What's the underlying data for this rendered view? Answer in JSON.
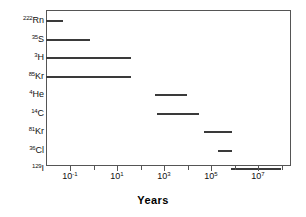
{
  "chart_data": {
    "type": "bar",
    "title": "",
    "xlabel": "Years",
    "ylabel": "",
    "xscale": "log",
    "xlim": [
      0.003,
      300000000
    ],
    "grid": false,
    "legend": null,
    "orientation": "horizontal-range",
    "note": "Applicable dating range of each radio-isotope tracer, shown as a horizontal span on a logarithmic time axis.",
    "categories": [
      "222Rn",
      "35S",
      "3H",
      "85Kr",
      "4He",
      "14C",
      "81Kr",
      "36Cl",
      "129I"
    ],
    "ranges": [
      {
        "label": "222Rn",
        "isotope_mass": "222",
        "isotope_symbol": "Rn",
        "start": 0.003,
        "end": 0.05
      },
      {
        "label": "35S",
        "isotope_mass": "35",
        "isotope_symbol": "S",
        "start": 0.003,
        "end": 0.7
      },
      {
        "label": "3H",
        "isotope_mass": "3",
        "isotope_symbol": "H",
        "start": 0.003,
        "end": 40
      },
      {
        "label": "85Kr",
        "isotope_mass": "85",
        "isotope_symbol": "Kr",
        "start": 0.003,
        "end": 40
      },
      {
        "label": "4He",
        "isotope_mass": "4",
        "isotope_symbol": "He",
        "start": 400,
        "end": 10000
      },
      {
        "label": "14C",
        "isotope_mass": "14",
        "isotope_symbol": "C",
        "start": 500,
        "end": 30000
      },
      {
        "label": "81Kr",
        "isotope_mass": "81",
        "isotope_symbol": "Kr",
        "start": 50000,
        "end": 800000
      },
      {
        "label": "36Cl",
        "isotope_mass": "36",
        "isotope_symbol": "Cl",
        "start": 200000,
        "end": 800000
      },
      {
        "label": "129I",
        "isotope_mass": "129",
        "isotope_symbol": "I",
        "start": 700000,
        "end": 100000000
      }
    ],
    "xticks": [
      {
        "value": 0.1,
        "label": "10-1",
        "mantissa": "10",
        "exponent": "-1",
        "major": true
      },
      {
        "value": 10,
        "label": "101",
        "mantissa": "10",
        "exponent": "1",
        "major": true
      },
      {
        "value": 1000,
        "label": "103",
        "mantissa": "10",
        "exponent": "3",
        "major": true
      },
      {
        "value": 100000,
        "label": "105",
        "mantissa": "10",
        "exponent": "5",
        "major": true
      },
      {
        "value": 10000000,
        "label": "107",
        "mantissa": "10",
        "exponent": "7",
        "major": true
      }
    ],
    "xticks_minor": [
      0.001,
      1,
      100,
      10000,
      1000000,
      100000000
    ],
    "colors": {
      "bar": "#3a3a3a",
      "axis": "#555555",
      "text": "#111111",
      "background": "#ffffff"
    }
  }
}
